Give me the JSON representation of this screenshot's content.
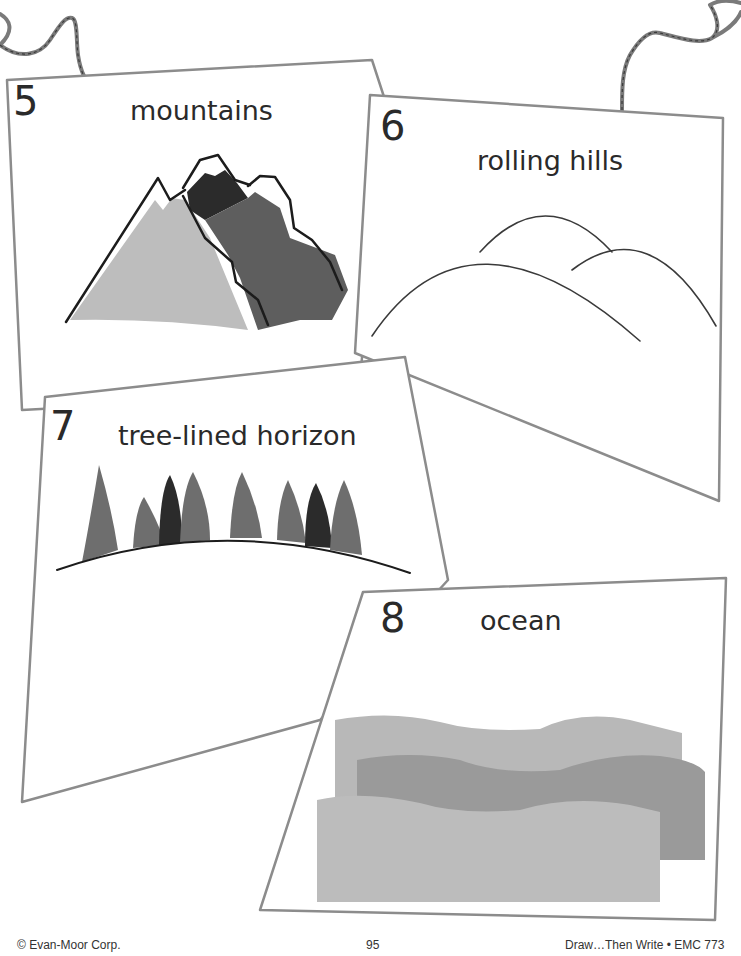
{
  "page": {
    "footer_left": "© Evan-Moor Corp.",
    "footer_center": "95",
    "footer_right": "Draw…Then Write • EMC 773"
  },
  "cards": [
    {
      "number": "5",
      "title": "mountains",
      "illustration": "mountains-icon"
    },
    {
      "number": "6",
      "title": "rolling hills",
      "illustration": "rolling-hills-icon"
    },
    {
      "number": "7",
      "title": "tree-lined horizon",
      "illustration": "tree-line-icon"
    },
    {
      "number": "8",
      "title": "ocean",
      "illustration": "ocean-waves-icon"
    }
  ],
  "colors": {
    "card_border": "#8c8c8c",
    "ink": "#1c1c1c",
    "light_gray": "#bdbdbd",
    "mid_gray": "#7a7a7a",
    "dark_gray": "#5a5a5a",
    "near_black": "#2b2b2b",
    "ocean_light": "#b8b8b8",
    "ocean_dark": "#9a9a9a"
  }
}
